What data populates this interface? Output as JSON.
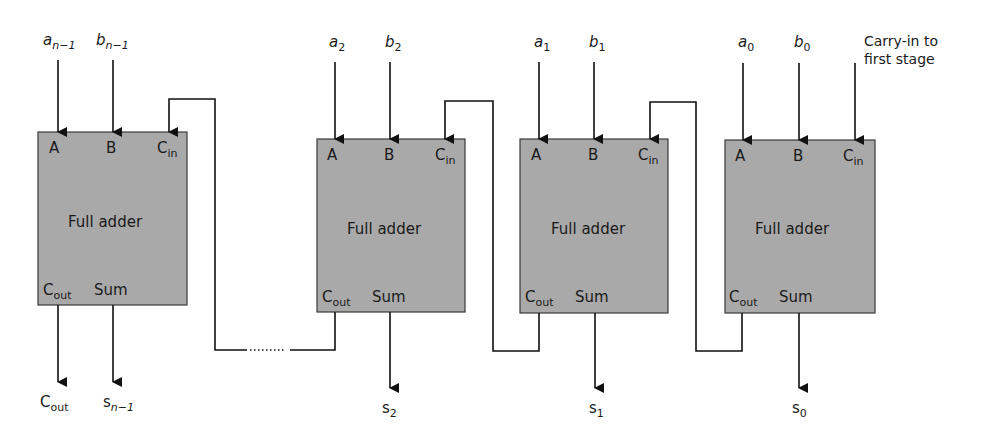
{
  "diagram": {
    "block_title": "Full adder",
    "port_labels": {
      "a": "A",
      "b": "B",
      "cin_main": "C",
      "cin_sub": "in",
      "cout_main": "C",
      "cout_sub": "out",
      "sum": "Sum"
    },
    "carry_in_note_line1": "Carry-in to",
    "carry_in_note_line2": "first stage",
    "final_carry_out": {
      "main": "C",
      "sub": "out"
    },
    "stages": [
      {
        "id": "n-1",
        "a_main": "a",
        "a_sub": "n−1",
        "b_main": "b",
        "b_sub": "n−1",
        "s_main": "s",
        "s_sub": "n−1"
      },
      {
        "id": "2",
        "a_main": "a",
        "a_sub": "2",
        "b_main": "b",
        "b_sub": "2",
        "s_main": "s",
        "s_sub": "2"
      },
      {
        "id": "1",
        "a_main": "a",
        "a_sub": "1",
        "b_main": "b",
        "b_sub": "1",
        "s_main": "s",
        "s_sub": "1"
      },
      {
        "id": "0",
        "a_main": "a",
        "a_sub": "0",
        "b_main": "b",
        "b_sub": "0",
        "s_main": "s",
        "s_sub": "0"
      }
    ],
    "colors": {
      "block_fill": "#a9a9a9",
      "line": "#111111",
      "background": "#ffffff"
    }
  }
}
